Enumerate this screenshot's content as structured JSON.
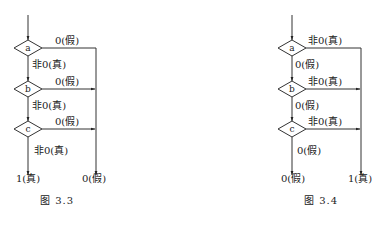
{
  "figures": [
    {
      "caption": "图  3.3",
      "nodes": [
        "a",
        "b",
        "c"
      ],
      "branch_labels": {
        "a_right": "0(假)",
        "a_down": "非0(真)",
        "b_right": "0(假)",
        "b_down": "非0(真)",
        "c_right": "0(假)",
        "c_down": "非0(真)"
      },
      "outputs": {
        "left": "1(真)",
        "right": "0(假)"
      }
    },
    {
      "caption": "图  3.4",
      "nodes": [
        "a",
        "b",
        "c"
      ],
      "branch_labels": {
        "a_right": "非0(真)",
        "a_down": "0(假)",
        "b_right": "非0(真)",
        "b_down": "0(假)",
        "c_right": "非0(真)",
        "c_down": "0(假)"
      },
      "outputs": {
        "left": "0(假)",
        "right": "1(真)"
      }
    }
  ]
}
